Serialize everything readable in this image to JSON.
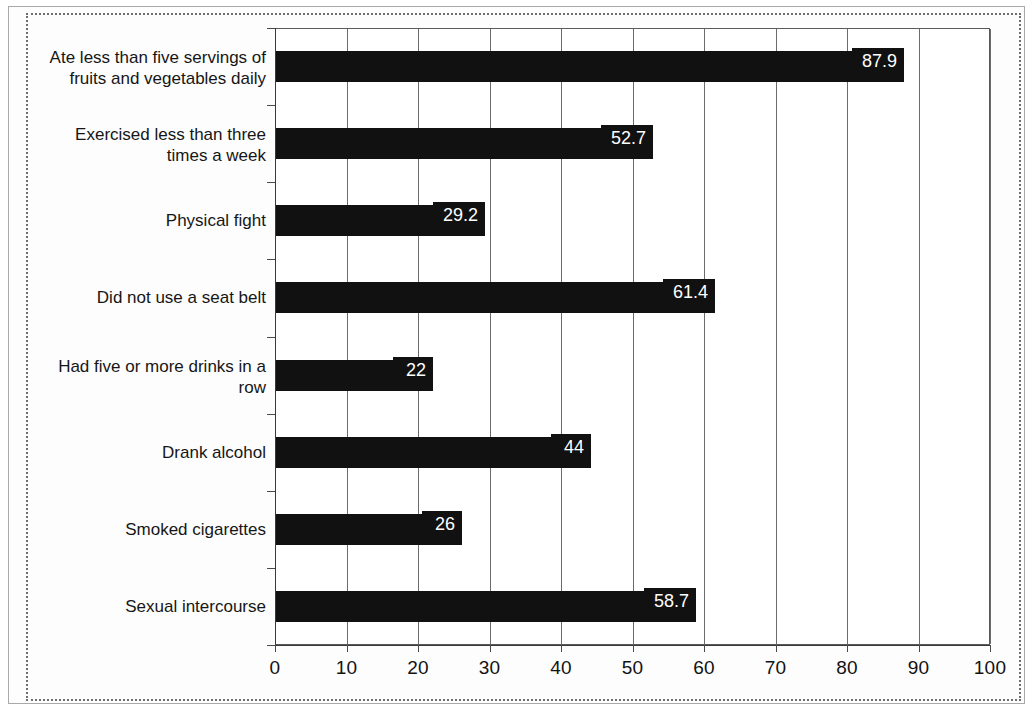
{
  "chart_data": {
    "type": "bar",
    "orientation": "horizontal",
    "title": "",
    "subtitle": "",
    "xlabel": "",
    "ylabel": "",
    "xlim": [
      0,
      100
    ],
    "grid": true,
    "legend": false,
    "xticks": [
      "0",
      "10",
      "20",
      "30",
      "40",
      "50",
      "60",
      "70",
      "80",
      "90",
      "100"
    ],
    "xtick_values": [
      0,
      10,
      20,
      30,
      40,
      50,
      60,
      70,
      80,
      90,
      100
    ],
    "categories": [
      "Ate less than five servings of fruits and vegetables daily",
      "Exercised less than three times a week",
      "Physical fight",
      "Did not use a seat belt",
      "Had five or more drinks in a row",
      "Drank alcohol",
      "Smoked cigarettes",
      "Sexual intercourse"
    ],
    "values": [
      87.9,
      52.7,
      29.2,
      61.4,
      22,
      44,
      26,
      58.7
    ],
    "value_labels": [
      "87.9",
      "52.7",
      "29.2",
      "61.4",
      "22",
      "44",
      "26",
      "58.7"
    ],
    "bar_color": "#111111",
    "value_label_color": "#ffffff"
  },
  "bars": [
    {
      "label_line1": "Ate less than five servings of",
      "label_line2": "fruits and vegetables daily",
      "value": 87.9,
      "value_label": "87.9"
    },
    {
      "label_line1": "Exercised less than three",
      "label_line2": "times a week",
      "value": 52.7,
      "value_label": "52.7"
    },
    {
      "label_line1": "Physical fight",
      "label_line2": "",
      "value": 29.2,
      "value_label": "29.2"
    },
    {
      "label_line1": "Did not use a seat belt",
      "label_line2": "",
      "value": 61.4,
      "value_label": "61.4"
    },
    {
      "label_line1": "Had five or more drinks in a",
      "label_line2": "row",
      "value": 22,
      "value_label": "22"
    },
    {
      "label_line1": "Drank alcohol",
      "label_line2": "",
      "value": 44,
      "value_label": "44"
    },
    {
      "label_line1": "Smoked cigarettes",
      "label_line2": "",
      "value": 26,
      "value_label": "26"
    },
    {
      "label_line1": "Sexual intercourse",
      "label_line2": "",
      "value": 58.7,
      "value_label": "58.7"
    }
  ],
  "axis": {
    "ticks": [
      "0",
      "10",
      "20",
      "30",
      "40",
      "50",
      "60",
      "70",
      "80",
      "90",
      "100"
    ]
  },
  "colors": {
    "bar": "#111111",
    "grid": "#6b6b6b",
    "axis": "#3a3a3a",
    "text": "#121212",
    "frame_outer": "#a9a9a9",
    "frame_dotted": "#6f6f6f"
  }
}
